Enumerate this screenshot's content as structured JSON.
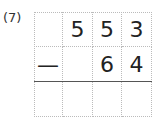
{
  "problem": {
    "label": "(7)",
    "rows": [
      [
        "",
        "5",
        "5",
        "3"
      ],
      [
        "—",
        "",
        "6",
        "4"
      ],
      [
        "",
        "",
        "",
        ""
      ]
    ]
  }
}
